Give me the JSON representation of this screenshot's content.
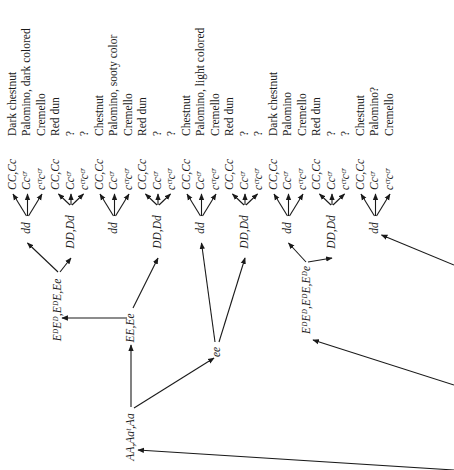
{
  "diagram": {
    "orientation": "rotated-90-ccw",
    "root": {
      "label": "AA,Aaᵗ,Aa",
      "x": 131,
      "y": 435
    },
    "level1": [
      {
        "id": "EE",
        "label": "EE,Ee",
        "x": 131,
        "y": 325
      },
      {
        "id": "ee",
        "label": "ee",
        "x": 217,
        "y": 350
      }
    ],
    "level2": [
      {
        "id": "ED1",
        "label": "EᴰEᴰ,EᴰE,Ee",
        "x": 62,
        "y": 310,
        "parent": "EE"
      },
      {
        "id": "ED2",
        "label": "EᴰEᴰ,EᴰE,Eᴰe",
        "x": 307,
        "y": 300,
        "parent": "offscreen"
      }
    ],
    "level3": [
      {
        "id": "n1",
        "label": "dd",
        "x": 28,
        "y": 232,
        "parent": "ED1",
        "type": "dd"
      },
      {
        "id": "n2",
        "label": "DD,Dd",
        "x": 70,
        "y": 240,
        "parent": "ED1",
        "type": "DD"
      },
      {
        "id": "n3",
        "label": "dd",
        "x": 115,
        "y": 232,
        "parent": "EE",
        "type": "dd"
      },
      {
        "id": "n4",
        "label": "DD,Dd",
        "x": 159,
        "y": 240,
        "parent": "EE",
        "type": "DD"
      },
      {
        "id": "n5",
        "label": "dd",
        "x": 202,
        "y": 232,
        "parent": "ee",
        "type": "dd"
      },
      {
        "id": "n6",
        "label": "DD,Dd",
        "x": 245,
        "y": 240,
        "parent": "ee",
        "type": "DD"
      },
      {
        "id": "n7",
        "label": "dd",
        "x": 288,
        "y": 232,
        "parent": "ED2",
        "type": "dd"
      },
      {
        "id": "n8",
        "label": "DD,Dd",
        "x": 333,
        "y": 240,
        "parent": "ED2",
        "type": "DD"
      },
      {
        "id": "n9",
        "label": "dd",
        "x": 377,
        "y": 232,
        "parent": "offscreen",
        "type": "dd"
      }
    ],
    "leaf_genotypes": [
      "CC,Cc",
      "Ccᶜʳ",
      "cᶜʳcᶜʳ"
    ],
    "phenotype_groups": [
      [
        "Dark chestnut",
        "Palomino, dark colored",
        "Cremello"
      ],
      [
        "Red dun",
        "?",
        "?"
      ],
      [
        "Chestnut",
        "Palomino, sooty color",
        "Cremello"
      ],
      [
        "Red dun",
        "?",
        "?"
      ],
      [
        "Chestnut",
        "Palomino, light colored",
        "Cremello"
      ],
      [
        "Red dun",
        "?",
        "?"
      ],
      [
        "Dark chestnut",
        "Palomino",
        "Cremello"
      ],
      [
        "Red dun",
        "?",
        "?"
      ],
      [
        "Chestnut",
        "Palomino?",
        "Cremello"
      ]
    ],
    "offscreen_arrows": [
      {
        "from": [
          454,
          425
        ],
        "to": "root"
      },
      {
        "from": [
          454,
          385
        ],
        "to": "ED2"
      },
      {
        "from": [
          454,
          265
        ],
        "to": "n9"
      }
    ]
  }
}
